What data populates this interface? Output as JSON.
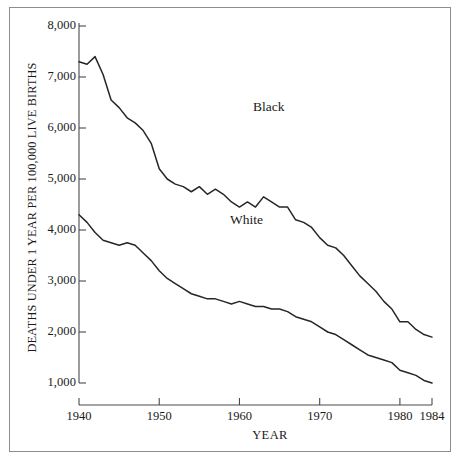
{
  "chart_data": {
    "type": "line",
    "title": "",
    "xlabel": "YEAR",
    "ylabel": "DEATHS UNDER 1 YEAR PER 100,000 LIVE BIRTHS",
    "xlim": [
      1940,
      1984
    ],
    "ylim": [
      1000,
      8000
    ],
    "grid": false,
    "legend_position": "inline-annotation",
    "yticks": [
      {
        "value": 8000,
        "label": "8,000"
      },
      {
        "value": 7000,
        "label": "7,000"
      },
      {
        "value": 6000,
        "label": "6,000"
      },
      {
        "value": 5000,
        "label": "5,000"
      },
      {
        "value": 4000,
        "label": "4,000"
      },
      {
        "value": 3000,
        "label": "3,000"
      },
      {
        "value": 2000,
        "label": "2,000"
      },
      {
        "value": 1000,
        "label": "1,000"
      }
    ],
    "xticks": [
      {
        "value": 1940,
        "label": "1940"
      },
      {
        "value": 1950,
        "label": "1950"
      },
      {
        "value": 1960,
        "label": "1960"
      },
      {
        "value": 1970,
        "label": "1970"
      },
      {
        "value": 1980,
        "label": "1980"
      },
      {
        "value": 1984,
        "label": "1984"
      }
    ],
    "x": [
      1940,
      1941,
      1942,
      1943,
      1944,
      1945,
      1946,
      1947,
      1948,
      1949,
      1950,
      1951,
      1952,
      1953,
      1954,
      1955,
      1956,
      1957,
      1958,
      1959,
      1960,
      1961,
      1962,
      1963,
      1964,
      1965,
      1966,
      1967,
      1968,
      1969,
      1970,
      1971,
      1972,
      1973,
      1974,
      1975,
      1976,
      1977,
      1978,
      1979,
      1980,
      1981,
      1982,
      1983,
      1984
    ],
    "series": [
      {
        "name": "Black",
        "color": "#262626",
        "label": "Black",
        "values": [
          7300,
          7250,
          7400,
          7050,
          6550,
          6400,
          6200,
          6100,
          5950,
          5700,
          5200,
          5000,
          4900,
          4850,
          4750,
          4850,
          4700,
          4800,
          4700,
          4550,
          4450,
          4550,
          4450,
          4650,
          4550,
          4450,
          4450,
          4200,
          4150,
          4050,
          3850,
          3700,
          3650,
          3500,
          3300,
          3100,
          2950,
          2800,
          2600,
          2450,
          2200,
          2200,
          2050,
          1950,
          1900
        ]
      },
      {
        "name": "White",
        "color": "#262626",
        "label": "White",
        "values": [
          4300,
          4150,
          3950,
          3800,
          3750,
          3700,
          3750,
          3700,
          3550,
          3400,
          3200,
          3050,
          2950,
          2850,
          2750,
          2700,
          2650,
          2650,
          2600,
          2550,
          2600,
          2550,
          2500,
          2500,
          2450,
          2450,
          2400,
          2300,
          2250,
          2200,
          2100,
          2000,
          1950,
          1850,
          1750,
          1650,
          1550,
          1500,
          1450,
          1400,
          1250,
          1200,
          1150,
          1050,
          1000
        ]
      }
    ]
  },
  "axis": {
    "y_title": "DEATHS UNDER 1 YEAR PER 100,000 LIVE BIRTHS",
    "x_title": "YEAR"
  },
  "annotations": {
    "black_label": "Black",
    "white_label": "White"
  }
}
